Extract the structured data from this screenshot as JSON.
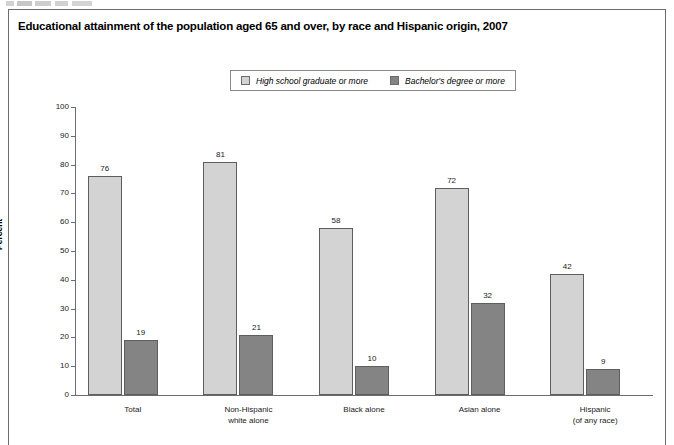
{
  "figure": {
    "title": "Educational attainment of the population aged 65 and over, by race and Hispanic origin, 2007"
  },
  "legend": {
    "items": [
      {
        "label": "High school graduate or more",
        "color": "#d3d3d3",
        "name": "hs-grad"
      },
      {
        "label": "Bachelor's degree or more",
        "color": "#848484",
        "name": "bachelors"
      }
    ]
  },
  "axes": {
    "ylabel": "Percent",
    "yticks": [
      "0",
      "10",
      "20",
      "30",
      "40",
      "50",
      "60",
      "70",
      "80",
      "90",
      "100"
    ]
  },
  "chart_data": {
    "type": "bar",
    "title": "Educational attainment of the population aged 65 and over, by race and Hispanic origin, 2007",
    "xlabel": "",
    "ylabel": "Percent",
    "ylim": [
      0,
      100
    ],
    "ytick_step": 10,
    "grid": false,
    "legend_position": "top-center",
    "categories": [
      "Total",
      "Non-Hispanic\nwhite alone",
      "Black alone",
      "Asian alone",
      "Hispanic\n(of any race)"
    ],
    "series": [
      {
        "name": "High school graduate or more",
        "color": "#d3d3d3",
        "values": [
          76,
          81,
          58,
          72,
          42
        ]
      },
      {
        "name": "Bachelor's degree or more",
        "color": "#848484",
        "values": [
          19,
          21,
          10,
          32,
          9
        ]
      }
    ]
  }
}
